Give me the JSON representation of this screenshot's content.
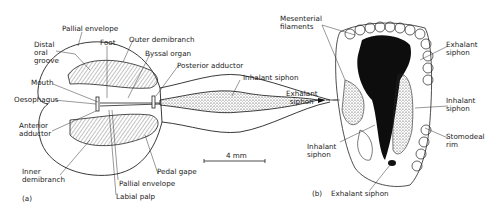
{
  "figure_a": {
    "panel_label": "(a)",
    "labels": {
      "pallial_envelope_top": "Pallial envelope",
      "foot": "Foot",
      "outer_demibranch": "Outer demibranch",
      "distal_oral_groove": "Distal\noral\ngroove",
      "byssal_organ": "Byssal organ",
      "posterior_adductor": "Posterior adductor",
      "mouth": "Mouth",
      "oesophagus": "Oesophagus",
      "inhalant_siphon": "Inhalant siphon",
      "exhalant_siphon": "Exhalant\nsiphon",
      "anterior_adductor": "Anterior\nadductor",
      "inner_demibranch": "Inner\ndemibranch",
      "pedal_gape": "Pedal gape",
      "pallial_envelope_bottom": "Pallial envelope",
      "labial_palp": "Labial palp"
    },
    "scale_bar": "4 mm"
  },
  "figure_b": {
    "panel_label": "(b)",
    "labels": {
      "mesenterial_filaments": "Mesenterial\nfilaments",
      "exhalant_siphon_top": "Exhalant\nsiphon",
      "inhalant_siphon_right": "Inhalant\nsiphon",
      "stomodeal_rim": "Stomodeal\nrim",
      "inhalant_siphon_left": "Inhalant\nsiphon",
      "exhalant_siphon_bottom": "Exhalant siphon"
    }
  },
  "colors": {
    "ink": "#1a1a1a",
    "background": "#ffffff"
  }
}
